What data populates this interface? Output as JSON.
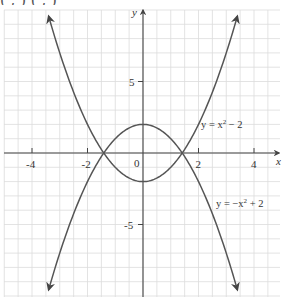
{
  "header_fragment": "(   ,   )    (   ,   )",
  "chart_data": {
    "type": "line",
    "title": "",
    "xlabel": "x",
    "ylabel": "y",
    "xlim": [
      -5.15,
      4.95
    ],
    "ylim": [
      -10.0,
      10.0
    ],
    "grid": true,
    "x_ticks": [
      {
        "value": -4,
        "label": "-4"
      },
      {
        "value": -2,
        "label": "-2"
      },
      {
        "value": 2,
        "label": "2"
      },
      {
        "value": 4,
        "label": "4"
      }
    ],
    "y_ticks": [
      {
        "value": 5,
        "label": "5"
      },
      {
        "value": -5,
        "label": "-5"
      }
    ],
    "origin_label": "0",
    "series": [
      {
        "name": "y = x² − 2",
        "label_main": "y = x",
        "label_sup": "2",
        "label_tail": " − 2",
        "expr": "x^2 - 2",
        "x_range": [
          -3.4,
          3.4
        ],
        "vertex": [
          0,
          -2
        ],
        "color": "#555555"
      },
      {
        "name": "y = −x² + 2",
        "label_main": "y = −x",
        "label_sup": "2",
        "label_tail": " + 2",
        "expr": "-x^2 + 2",
        "x_range": [
          -3.4,
          3.4
        ],
        "vertex": [
          0,
          2
        ],
        "color": "#555555"
      }
    ],
    "intersections": [
      [
        -1.414,
        0
      ],
      [
        1.414,
        0
      ]
    ],
    "annotations": [
      {
        "text": "y = x² − 2",
        "near_series": 0,
        "position": "right of curve, above x-axis"
      },
      {
        "text": "y = −x² + 2",
        "near_series": 1,
        "position": "right of curve, below x-axis"
      }
    ]
  }
}
